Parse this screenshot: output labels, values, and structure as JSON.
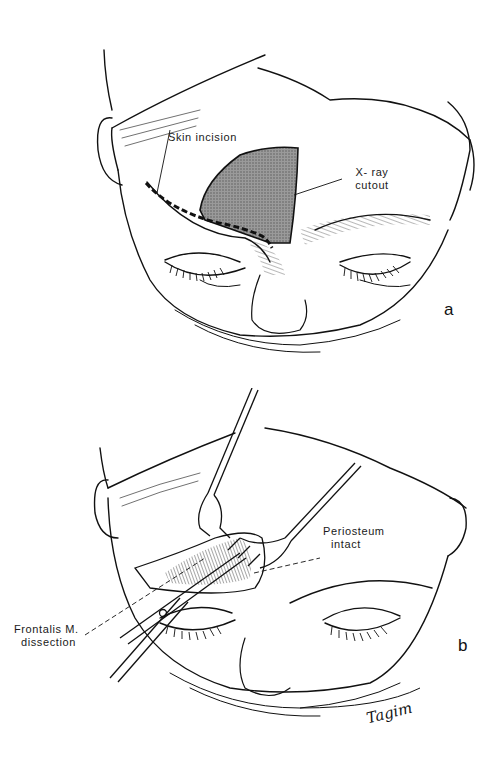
{
  "figure": {
    "panels": [
      {
        "id": "a",
        "letter": "a",
        "labels": {
          "skin_incision": "Skin incision",
          "xray_line1": "X- ray",
          "xray_line2": "cutout"
        }
      },
      {
        "id": "b",
        "letter": "b",
        "labels": {
          "periosteum_line1": "Periosteum",
          "periosteum_line2": "intact",
          "frontalis_line1": "Frontalis M.",
          "frontalis_line2": "dissection"
        }
      }
    ],
    "signature": "Tagim",
    "colors": {
      "line": "#111111",
      "cutout_fill": "#8a8a8a",
      "background": "#ffffff"
    }
  }
}
